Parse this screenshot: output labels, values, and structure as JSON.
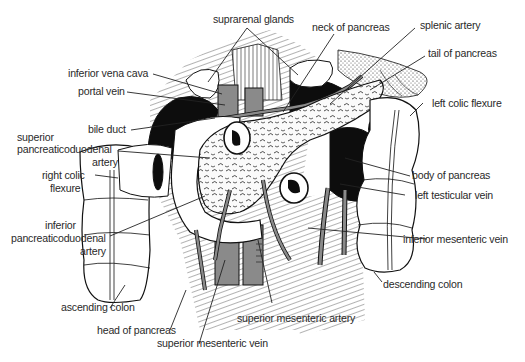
{
  "figure": {
    "colors": {
      "background": "#ffffff",
      "ink": "#111111",
      "vessel_gray": "#8a8a8a",
      "dark_fill": "#0d0d0d",
      "label_text": "#2a2a2a"
    }
  },
  "labels": {
    "suprarenal_glands": "suprarenal glands",
    "neck_of_pancreas": "neck of pancreas",
    "splenic_artery": "splenic artery",
    "tail_of_pancreas": "tail of pancreas",
    "inferior_vena_cava": "inferior vena cava",
    "portal_vein": "portal vein",
    "left_colic_flexure": "left colic flexure",
    "bile_duct": "bile duct",
    "superior_pd_artery_1": "superior",
    "superior_pd_artery_2": "pancreaticoduodenal",
    "superior_pd_artery_3": "artery",
    "body_of_pancreas": "body of pancreas",
    "right_colic_flexure_1": "right colic",
    "right_colic_flexure_2": "flexure",
    "left_testicular_vein": "left testicular vein",
    "inferior_pd_artery_1": "inferior",
    "inferior_pd_artery_2": "pancreaticoduodenal",
    "inferior_pd_artery_3": "artery",
    "inferior_mesenteric_vein": "inferior mesenteric vein",
    "ascending_colon": "ascending colon",
    "descending_colon": "descending colon",
    "head_of_pancreas": "head of pancreas",
    "superior_mesenteric_artery": "superior mesenteric artery",
    "superior_mesenteric_vein": "superior mesenteric vein"
  }
}
